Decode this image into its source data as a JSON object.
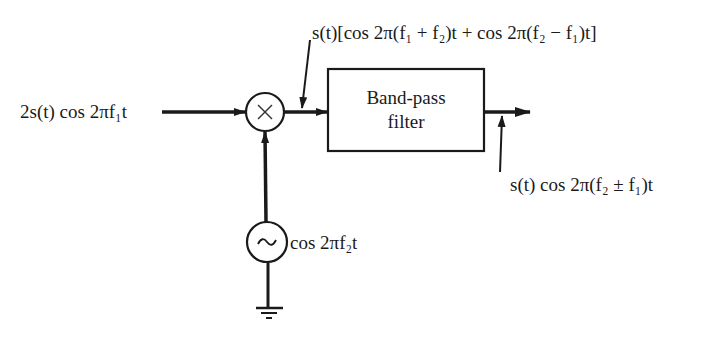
{
  "diagram": {
    "type": "block-diagram",
    "input_signal": {
      "label": "2s(t) cos 2πf₁t"
    },
    "mixer": {
      "symbol": "×"
    },
    "mixer_output": {
      "label": "s(t)[cos 2π(f₁ + f₂)t + cos 2π(f₂ − f₁)t]"
    },
    "filter": {
      "line1": "Band-pass",
      "line2": "filter"
    },
    "output_signal": {
      "label": "s(t) cos 2π(f₂ ± f₁)t"
    },
    "oscillator": {
      "symbol": "~",
      "label": "cos 2πf₂t"
    },
    "ground": {
      "symbol": "ground"
    }
  },
  "colors": {
    "ink": "#1a1a1a",
    "background": "#ffffff"
  }
}
